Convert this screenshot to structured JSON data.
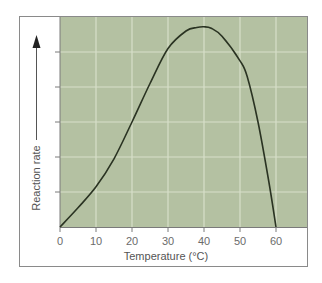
{
  "chart_data": {
    "type": "line",
    "title": "",
    "xlabel": "Temperature (°C)",
    "ylabel": "Reaction rate",
    "x_ticks": [
      "0",
      "10",
      "20",
      "30",
      "40",
      "50",
      "60"
    ],
    "xlim": [
      0,
      67
    ],
    "ylim": [
      0,
      6
    ],
    "y_tick_labels_shown": false,
    "grid": true,
    "legend": null,
    "series": [
      {
        "name": "Reaction rate",
        "x": [
          0,
          5,
          10,
          15,
          20,
          25,
          30,
          35,
          38,
          40,
          42,
          45,
          50,
          52,
          55,
          58,
          60
        ],
        "values": [
          0,
          0.55,
          1.15,
          1.95,
          3.0,
          4.1,
          5.1,
          5.6,
          5.7,
          5.72,
          5.68,
          5.45,
          4.75,
          4.3,
          3.0,
          1.3,
          0
        ]
      }
    ],
    "colors": {
      "plot_background": "#b4c1a2",
      "gridline": "#d7dfca",
      "curve": "#2a3322",
      "frame": "#8a8a8a",
      "text": "#666666"
    }
  }
}
